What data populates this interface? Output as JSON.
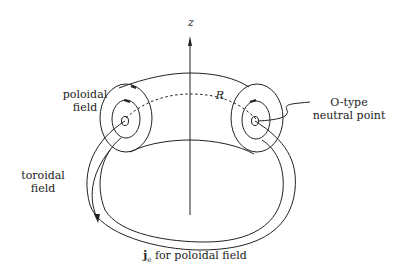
{
  "diagram": {
    "axis_label": "z",
    "radius_label": "R",
    "labels": {
      "poloidal_field_line1": "poloidal",
      "poloidal_field_line2": "field",
      "toroidal_field_line1": "toroidal",
      "toroidal_field_line2": "field",
      "neutral_point_line1": "O-type",
      "neutral_point_line2": "neutral point",
      "current_symbol": "j",
      "current_subscript": "e",
      "current_text": " for poloidal field"
    },
    "colors": {
      "stroke": "#222222",
      "background": "#ffffff"
    }
  }
}
